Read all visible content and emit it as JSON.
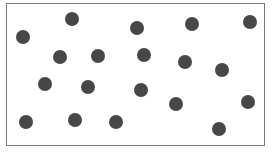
{
  "figure": {
    "frame": {
      "left": 6,
      "top": 3,
      "right": 265,
      "bottom": 146,
      "border_color": "#7a7a7a"
    },
    "dot_color": "#474747",
    "dot_radius": 7,
    "dot_count": 19,
    "dots": [
      {
        "x": 23,
        "y": 37
      },
      {
        "x": 72,
        "y": 19
      },
      {
        "x": 137,
        "y": 28
      },
      {
        "x": 192,
        "y": 24
      },
      {
        "x": 250,
        "y": 22
      },
      {
        "x": 60,
        "y": 57
      },
      {
        "x": 98,
        "y": 56
      },
      {
        "x": 144,
        "y": 55
      },
      {
        "x": 185,
        "y": 62
      },
      {
        "x": 222,
        "y": 70
      },
      {
        "x": 45,
        "y": 84
      },
      {
        "x": 88,
        "y": 87
      },
      {
        "x": 141,
        "y": 90
      },
      {
        "x": 176,
        "y": 104
      },
      {
        "x": 248,
        "y": 102
      },
      {
        "x": 26,
        "y": 122
      },
      {
        "x": 75,
        "y": 120
      },
      {
        "x": 116,
        "y": 122
      },
      {
        "x": 219,
        "y": 129
      }
    ]
  }
}
